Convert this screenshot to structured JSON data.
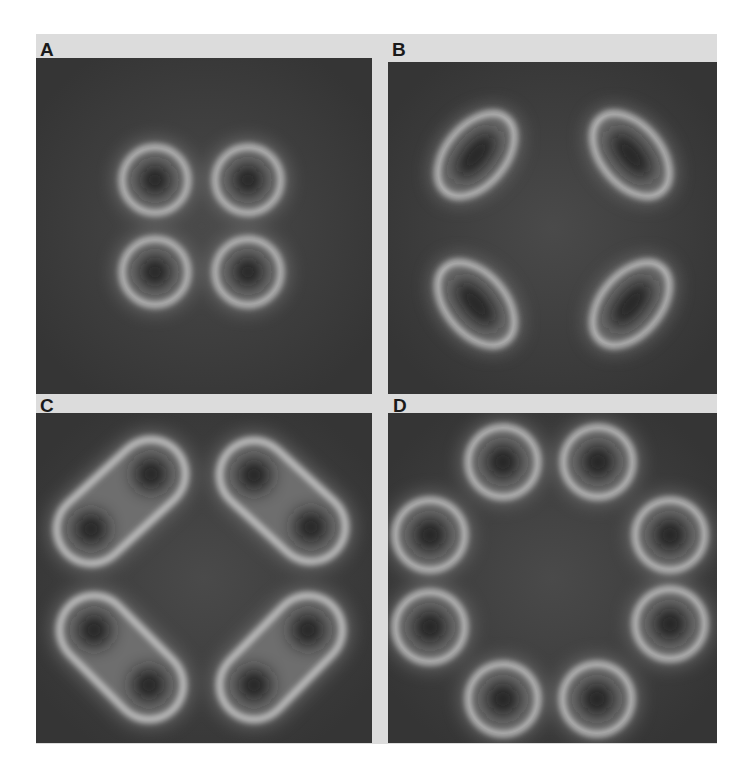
{
  "figure": {
    "background_band_color": "#dcdcdc",
    "panel_background_color": "#3c3c3c",
    "ring_color": "#d8d8d8",
    "core_color": "#1e1e1e",
    "panels": [
      {
        "label": "A",
        "description": "Four circular rings in a tight 2x2 arrangement",
        "shape": "circle",
        "box": {
          "x": 36,
          "y": 58,
          "w": 336,
          "h": 336
        },
        "label_pos": {
          "x": 40,
          "y": 40
        },
        "ring_radius": 33,
        "features": [
          {
            "cx": 155,
            "cy": 180
          },
          {
            "cx": 248,
            "cy": 180
          },
          {
            "cx": 155,
            "cy": 272
          },
          {
            "cx": 248,
            "cy": 272
          }
        ]
      },
      {
        "label": "B",
        "description": "Four elongated elliptical rings at corners, tangentially oriented",
        "shape": "ellipse",
        "box": {
          "x": 388,
          "y": 62,
          "w": 329,
          "h": 332
        },
        "label_pos": {
          "x": 392,
          "y": 40
        },
        "features": [
          {
            "cx": 476,
            "cy": 155,
            "rx": 48,
            "ry": 30,
            "angle": -50
          },
          {
            "cx": 631,
            "cy": 155,
            "rx": 48,
            "ry": 30,
            "angle": 50
          },
          {
            "cx": 476,
            "cy": 304,
            "rx": 48,
            "ry": 30,
            "angle": 50
          },
          {
            "cx": 631,
            "cy": 304,
            "rx": 48,
            "ry": 30,
            "angle": -50
          }
        ]
      },
      {
        "label": "C",
        "description": "Four peanut-shaped rings each with two dark cores",
        "shape": "peanut",
        "box": {
          "x": 36,
          "y": 413,
          "w": 336,
          "h": 330
        },
        "label_pos": {
          "x": 40,
          "y": 396
        },
        "ring_radius": 35,
        "features": [
          {
            "a": {
              "cx": 151,
              "cy": 474
            },
            "b": {
              "cx": 91,
              "cy": 529
            }
          },
          {
            "a": {
              "cx": 254,
              "cy": 475
            },
            "b": {
              "cx": 311,
              "cy": 527
            }
          },
          {
            "a": {
              "cx": 94,
              "cy": 630
            },
            "b": {
              "cx": 149,
              "cy": 685
            }
          },
          {
            "a": {
              "cx": 308,
              "cy": 630
            },
            "b": {
              "cx": 254,
              "cy": 685
            }
          }
        ]
      },
      {
        "label": "D",
        "description": "Eight circular rings arranged in an octagonal ring around a dark center",
        "shape": "circle",
        "box": {
          "x": 388,
          "y": 413,
          "w": 329,
          "h": 330
        },
        "label_pos": {
          "x": 393,
          "y": 396
        },
        "ring_radius": 35,
        "features": [
          {
            "cx": 503,
            "cy": 462
          },
          {
            "cx": 598,
            "cy": 462
          },
          {
            "cx": 430,
            "cy": 535
          },
          {
            "cx": 670,
            "cy": 535
          },
          {
            "cx": 430,
            "cy": 627
          },
          {
            "cx": 670,
            "cy": 624
          },
          {
            "cx": 503,
            "cy": 699
          },
          {
            "cx": 597,
            "cy": 699
          }
        ]
      }
    ]
  }
}
